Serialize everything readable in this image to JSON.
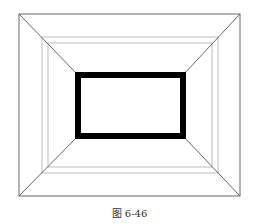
{
  "caption": "图 6-46",
  "colors": {
    "line": "#666666",
    "thin": "#9a9a9a",
    "frame": "#000000"
  },
  "diagram": {
    "outer": {
      "x1": 19,
      "y1": 14,
      "x2": 240,
      "y2": 196
    },
    "inner_a": {
      "x1": 42,
      "y1": 37,
      "x2": 218,
      "y2": 173
    },
    "inner_b": {
      "x1": 48,
      "y1": 43,
      "x2": 212,
      "y2": 167
    },
    "black_frame": {
      "x1": 78,
      "y1": 75,
      "x2": 183,
      "y2": 136,
      "stroke": 6
    }
  }
}
